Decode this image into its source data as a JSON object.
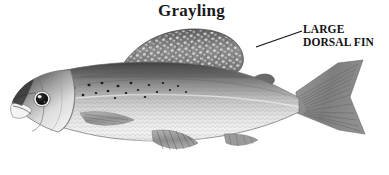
{
  "figure": {
    "title": "Grayling",
    "background_color": "#ffffff",
    "width": 389,
    "height": 175
  },
  "callout": {
    "line1": "LARGE",
    "line2": "DORSAL FIN",
    "leader_line_name": "leader-line"
  },
  "illustration": {
    "subject": "grayling-fish",
    "style": "grayscale-scientific-illustration",
    "orientation": "facing-left",
    "colors": {
      "back_dark": "#4a4a4a",
      "mid_gray": "#8c8c8c",
      "belly_light": "#ebebeb",
      "outline": "#555555",
      "spot": "#1c1c1c",
      "fin_gray": "#909090",
      "eye_dark": "#141414"
    },
    "parts": [
      {
        "name": "dorsal-fin",
        "label": "large dorsal fin"
      },
      {
        "name": "adipose-fin",
        "label": "adipose fin"
      },
      {
        "name": "caudal-fin",
        "label": "forked tail fin"
      },
      {
        "name": "anal-fin",
        "label": "anal fin"
      },
      {
        "name": "pelvic-fin",
        "label": "pelvic fin"
      },
      {
        "name": "pectoral-fin",
        "label": "pectoral fin"
      },
      {
        "name": "head",
        "label": "head"
      },
      {
        "name": "eye",
        "label": "eye"
      },
      {
        "name": "body",
        "label": "body"
      }
    ]
  }
}
